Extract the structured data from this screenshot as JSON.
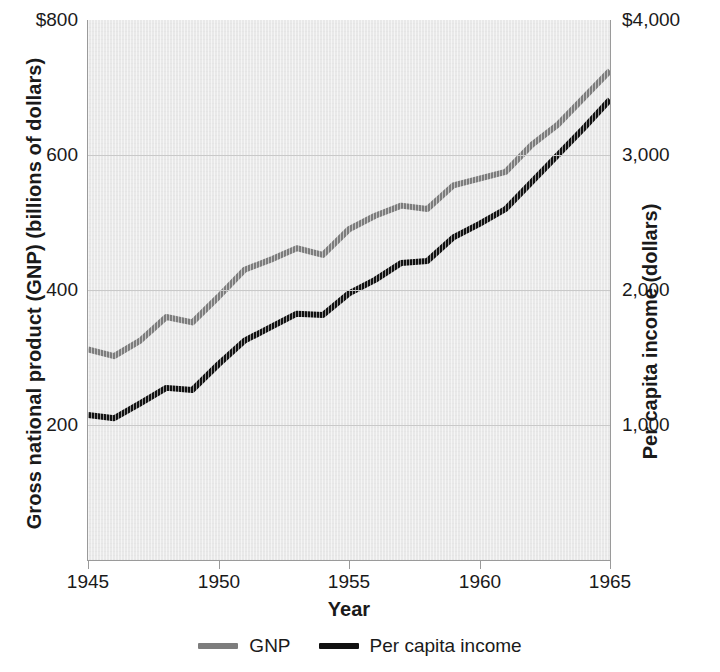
{
  "chart_data": {
    "type": "line",
    "title": "",
    "xlabel": "Year",
    "ylabel": "Gross national product (GNP) (billions of dollars)",
    "ylabel_right": "Per capita income (dollars)",
    "grid": true,
    "legend_position": "bottom",
    "x": [
      1945,
      1946,
      1947,
      1948,
      1949,
      1950,
      1951,
      1952,
      1953,
      1954,
      1955,
      1956,
      1957,
      1958,
      1959,
      1960,
      1961,
      1962,
      1963,
      1964,
      1965
    ],
    "xlim": [
      1945,
      1965
    ],
    "xticks": [
      1945,
      1950,
      1955,
      1960,
      1965
    ],
    "xtick_labels": [
      "1945",
      "1950",
      "1955",
      "1960",
      "1965"
    ],
    "ylim": [
      0,
      800
    ],
    "yticks": [
      200,
      400,
      600,
      800
    ],
    "ytick_labels": [
      "200",
      "400",
      "600",
      "$800"
    ],
    "ylim_right": [
      0,
      4000
    ],
    "yticks_right": [
      1000,
      2000,
      3000,
      4000
    ],
    "ytick_labels_right": [
      "1,000",
      "2,000",
      "3,000",
      "$4,000"
    ],
    "series": [
      {
        "name": "GNP",
        "axis": "left",
        "color": "#7d7d7d",
        "unit": "billions of dollars",
        "values": [
          312,
          302,
          325,
          360,
          352,
          390,
          430,
          445,
          462,
          452,
          490,
          510,
          525,
          520,
          555,
          565,
          575,
          615,
          645,
          685,
          725
        ]
      },
      {
        "name": "Per capita income",
        "axis": "right",
        "color": "#111111",
        "unit": "dollars",
        "values": [
          1075,
          1050,
          1160,
          1275,
          1260,
          1450,
          1625,
          1725,
          1825,
          1815,
          1975,
          2075,
          2200,
          2215,
          2390,
          2490,
          2600,
          2800,
          3000,
          3200,
          3410
        ]
      }
    ]
  },
  "legend": {
    "items": [
      {
        "label": "GNP",
        "color": "#7d7d7d"
      },
      {
        "label": "Per capita income",
        "color": "#111111"
      }
    ]
  },
  "colors": {
    "plot_background": "#e9e9e9",
    "gridline": "#c9c9c9",
    "axis": "#9a9a9a",
    "text": "#1a1a1a",
    "gnp_line": "#7d7d7d",
    "per_capita_line": "#111111"
  }
}
